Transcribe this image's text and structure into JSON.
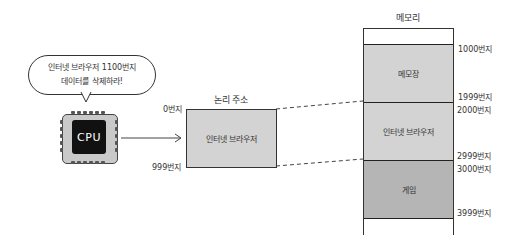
{
  "speech_bubble": {
    "line1": "인터넷 브라우저 1100번지",
    "line2": "데이터를 삭제하라!"
  },
  "cpu": {
    "label": "CPU"
  },
  "logical_address": {
    "title": "논리 주소",
    "block_label": "인터넷 브라우저",
    "start_label": "0번지",
    "end_label": "999번지"
  },
  "memory": {
    "title": "메모리",
    "segments": [
      {
        "label": "",
        "type": "empty"
      },
      {
        "label": "메모장",
        "start": "1000번지",
        "end": "1999번지"
      },
      {
        "label": "인터넷 브라우저",
        "start": "2000번지",
        "end": "2999번지"
      },
      {
        "label": "게임",
        "start": "3000번지",
        "end": "3999번지"
      },
      {
        "label": "",
        "type": "empty"
      }
    ]
  },
  "colors": {
    "block_fill": "#d3d3d3",
    "game_fill": "#b5b5b5",
    "chip_core": "#111111",
    "chip_body": "#c9c9c9",
    "line": "#333333"
  }
}
